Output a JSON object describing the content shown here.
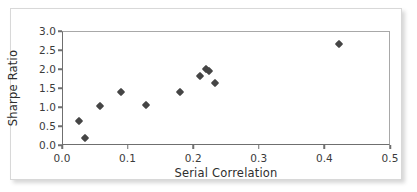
{
  "chart_data": {
    "type": "scatter",
    "title": "",
    "xlabel": "Serial Correlation",
    "ylabel": "Sharpe Ratio",
    "xlim": [
      0.0,
      0.5
    ],
    "ylim": [
      0.0,
      3.0
    ],
    "xticks": [
      "0.0",
      "0.1",
      "0.2",
      "0.3",
      "0.4",
      "0.5"
    ],
    "xtick_values": [
      0.0,
      0.1,
      0.2,
      0.3,
      0.4,
      0.5
    ],
    "yticks": [
      "0.0",
      "0.5",
      "1.0",
      "1.5",
      "2.0",
      "2.5",
      "3.0"
    ],
    "ytick_values": [
      0.0,
      0.5,
      1.0,
      1.5,
      2.0,
      2.5,
      3.0
    ],
    "grid": false,
    "legend": null,
    "marker": "diamond",
    "marker_color": "#454545",
    "points": [
      {
        "x": 0.025,
        "y": 0.67
      },
      {
        "x": 0.034,
        "y": 0.21
      },
      {
        "x": 0.056,
        "y": 1.06
      },
      {
        "x": 0.089,
        "y": 1.43
      },
      {
        "x": 0.127,
        "y": 1.09
      },
      {
        "x": 0.179,
        "y": 1.42
      },
      {
        "x": 0.209,
        "y": 1.85
      },
      {
        "x": 0.218,
        "y": 2.03
      },
      {
        "x": 0.223,
        "y": 1.98
      },
      {
        "x": 0.231,
        "y": 1.65
      },
      {
        "x": 0.421,
        "y": 2.68
      }
    ]
  },
  "axes": {
    "x_axis_label": "Serial Correlation",
    "y_axis_label": "Sharpe Ratio"
  }
}
